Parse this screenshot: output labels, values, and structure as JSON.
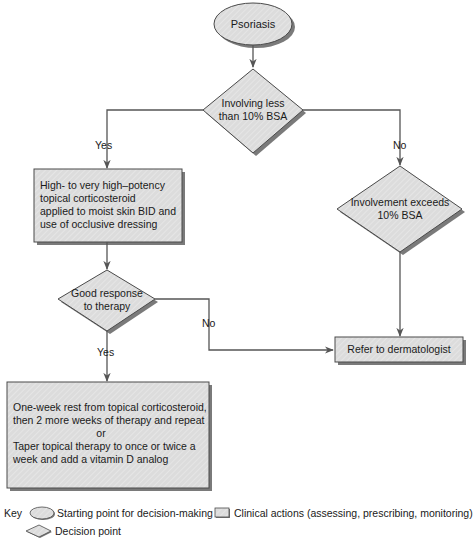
{
  "diagram": {
    "nodes": {
      "start": {
        "type": "oval",
        "label": "Psoriasis"
      },
      "decision_bsa": {
        "type": "diamond",
        "lines": [
          "Involving less",
          "than 10% BSA"
        ]
      },
      "action_topical": {
        "type": "box",
        "lines": [
          "High- to very high–potency",
          "topical corticosteroid",
          "applied to moist skin BID and",
          "use of occlusive dressing"
        ]
      },
      "decision_exceeds": {
        "type": "diamond",
        "lines": [
          "Involvement exceeds",
          "10% BSA"
        ]
      },
      "decision_response": {
        "type": "diamond",
        "lines": [
          "Good response",
          "to therapy"
        ]
      },
      "action_refer": {
        "type": "box",
        "label": "Refer to dermatologist"
      },
      "action_maintenance": {
        "type": "box",
        "lines": [
          "One-week rest from topical corticosteroid,",
          "then 2 more weeks of therapy and repeat",
          "or",
          "Taper topical therapy to once or twice a",
          "week and add a vitamin D analog"
        ]
      }
    },
    "edges": [
      {
        "from": "start",
        "to": "decision_bsa",
        "label": ""
      },
      {
        "from": "decision_bsa",
        "to": "action_topical",
        "label": "Yes"
      },
      {
        "from": "decision_bsa",
        "to": "decision_exceeds",
        "label": "No"
      },
      {
        "from": "action_topical",
        "to": "decision_response",
        "label": ""
      },
      {
        "from": "decision_response",
        "to": "action_refer",
        "label": "No"
      },
      {
        "from": "decision_exceeds",
        "to": "action_refer",
        "label": ""
      },
      {
        "from": "decision_response",
        "to": "action_maintenance",
        "label": "Yes"
      }
    ]
  },
  "labels": {
    "yes_1": "Yes",
    "no_1": "No",
    "no_2": "No",
    "yes_2": "Yes"
  },
  "key": {
    "title": "Key",
    "oval": "Starting point for decision-making",
    "box": "Clinical actions (assessing, prescribing, monitoring)",
    "diamond": "Decision point"
  },
  "colors": {
    "shape_fill": "#d9d9d9",
    "shape_stroke": "#4a4a4a",
    "shadow": "#7a7a7a",
    "line": "#555555"
  }
}
